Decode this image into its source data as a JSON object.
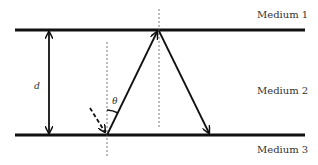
{
  "diagram": {
    "media": [
      {
        "label": "Medium 1"
      },
      {
        "label": "Medium 2"
      },
      {
        "label": "Medium 3"
      }
    ],
    "thickness_label": "d",
    "angle_label": "θ",
    "colors": {
      "line": "#111111",
      "text": "#333333",
      "dashed": "#555555"
    }
  }
}
